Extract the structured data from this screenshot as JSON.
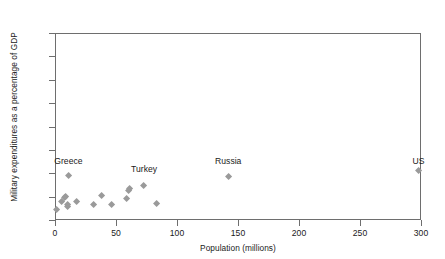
{
  "chart_data": {
    "type": "scatter",
    "title": "",
    "xlabel": "Population (millions)",
    "ylabel": "Military expenditures as a percentage of GDP",
    "xlim": [
      0,
      300
    ],
    "ylim": [
      0,
      16
    ],
    "xticks": [
      0,
      50,
      100,
      150,
      200,
      250,
      300
    ],
    "yticks": [
      0,
      2,
      4,
      6,
      8,
      10,
      12,
      14,
      16
    ],
    "xtick_labels": [
      "0",
      "50",
      "100",
      "150",
      "200",
      "250",
      "300"
    ],
    "ytick_labels": [
      "0",
      "2",
      "4",
      "6",
      "8",
      "10",
      "12",
      "14",
      "16"
    ],
    "grid": false,
    "legend": "none",
    "marker_shape": "diamond",
    "marker_color": "#9a9a9a",
    "axis_color": "#6e6e6e",
    "points": [
      {
        "x": 1,
        "y": 0.9,
        "label": ""
      },
      {
        "x": 5,
        "y": 1.55,
        "label": ""
      },
      {
        "x": 8,
        "y": 1.9,
        "label": ""
      },
      {
        "x": 9,
        "y": 2.0,
        "label": ""
      },
      {
        "x": 10,
        "y": 1.15,
        "label": ""
      },
      {
        "x": 10,
        "y": 1.35,
        "label": ""
      },
      {
        "x": 11,
        "y": 3.8,
        "label": "Greece"
      },
      {
        "x": 18,
        "y": 1.6,
        "label": ""
      },
      {
        "x": 32,
        "y": 1.3,
        "label": ""
      },
      {
        "x": 38,
        "y": 2.1,
        "label": ""
      },
      {
        "x": 46,
        "y": 1.35,
        "label": ""
      },
      {
        "x": 59,
        "y": 1.85,
        "label": ""
      },
      {
        "x": 60,
        "y": 2.55,
        "label": ""
      },
      {
        "x": 61,
        "y": 2.7,
        "label": ""
      },
      {
        "x": 73,
        "y": 2.95,
        "label": "Turkey"
      },
      {
        "x": 83,
        "y": 1.4,
        "label": ""
      },
      {
        "x": 142,
        "y": 3.75,
        "label": "Russia"
      },
      {
        "x": 298,
        "y": 4.2,
        "label": "US"
      }
    ],
    "annotations": [
      {
        "text": "Greece",
        "x": 11,
        "y": 5.0
      },
      {
        "text": "Turkey",
        "x": 73,
        "y": 4.3
      },
      {
        "text": "Russia",
        "x": 142,
        "y": 5.0
      },
      {
        "text": "US",
        "x": 298,
        "y": 5.0
      }
    ]
  }
}
